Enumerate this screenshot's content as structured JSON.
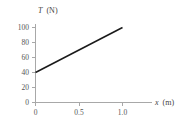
{
  "chart_data": {
    "type": "line",
    "title": "",
    "subtitle": "",
    "xlabel": "x (m)",
    "ylabel": "T (N)",
    "xlabel_var": "x",
    "xlabel_unit": "(m)",
    "ylabel_var": "T",
    "ylabel_unit": "(N)",
    "xlim": [
      0,
      1.15
    ],
    "ylim": [
      0,
      110
    ],
    "grid": false,
    "legend": null,
    "x_ticks": [
      0,
      0.5,
      1.0
    ],
    "x_tick_labels": [
      "0",
      "0.5",
      "1.0"
    ],
    "y_ticks": [
      0,
      20,
      40,
      60,
      80,
      100
    ],
    "y_tick_labels": [
      "0",
      "20",
      "40",
      "60",
      "80",
      "100"
    ],
    "series": [
      {
        "name": "tension",
        "x": [
          0,
          1.0
        ],
        "values": [
          40,
          100
        ]
      }
    ],
    "annotations": [],
    "colors": {
      "line": "#1a1a1a",
      "axis": "#a8a8a8",
      "text": "#555555",
      "background": "#ffffff"
    }
  }
}
